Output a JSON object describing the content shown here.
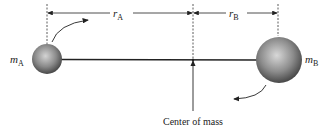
{
  "diagram": {
    "labels": {
      "mass_a": "m",
      "mass_a_sub": "A",
      "mass_b": "m",
      "mass_b_sub": "B",
      "r_a": "r",
      "r_a_sub": "A",
      "r_b": "r",
      "r_b_sub": "B",
      "center_of_mass": "Center of mass"
    },
    "elements": {
      "body_a": {
        "cx": 47,
        "cy": 59,
        "r": 15
      },
      "body_b": {
        "cx": 279,
        "cy": 60,
        "r": 23
      },
      "center_of_mass_x": 193,
      "dimension_line_y": 13
    },
    "colors": {
      "line": "#222222",
      "sphere_light": "#d8d8d8",
      "sphere_dark": "#3a3a3a"
    }
  }
}
